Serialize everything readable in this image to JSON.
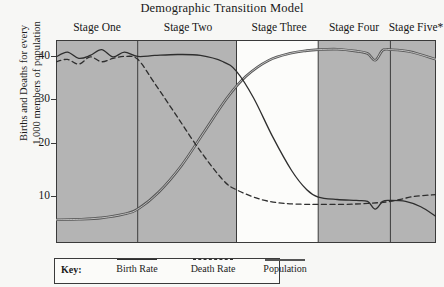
{
  "title": "Demographic Transition Model",
  "axis": {
    "ylabel_line1": "Births and Deaths for every",
    "ylabel_line2": "1,000 members of population",
    "yticks": [
      "40",
      "30",
      "20",
      "10"
    ]
  },
  "stages": [
    {
      "label": "Stage One",
      "shaded": true
    },
    {
      "label": "Stage Two",
      "shaded": true
    },
    {
      "label": "Stage Three",
      "shaded": false
    },
    {
      "label": "Stage Four",
      "shaded": true
    },
    {
      "label": "Stage Five*",
      "shaded": true
    }
  ],
  "legend": {
    "key_label": "Key:",
    "entries": [
      {
        "label": "Birth Rate",
        "style": "solid"
      },
      {
        "label": "Death Rate",
        "style": "dashed"
      },
      {
        "label": "Population",
        "style": "thick"
      }
    ]
  },
  "colors": {
    "shaded_band": "#b4b4b4",
    "unshaded_band": "#fcfcfa",
    "page_background": "#f7f7f5",
    "line": "#2e2e2e",
    "population_line": "#555555",
    "frame": "#3a3a3a"
  },
  "chart_data": {
    "type": "line",
    "title": "Demographic Transition Model",
    "xlabel": "",
    "ylabel": "Births and Deaths for every 1,000 members of population",
    "ylim": [
      0,
      42
    ],
    "xlim": [
      0,
      100
    ],
    "grid": false,
    "legend_position": "bottom-left",
    "stage_boundaries": [
      0,
      21.5,
      47.5,
      69,
      88,
      100
    ],
    "stage_names": [
      "Stage One",
      "Stage Two",
      "Stage Three",
      "Stage Four",
      "Stage Five*"
    ],
    "stage_shading": [
      "gray",
      "gray",
      "white",
      "gray",
      "gray"
    ],
    "series": [
      {
        "name": "Birth Rate",
        "style": "solid",
        "x": [
          0,
          3,
          6,
          9,
          12,
          15,
          18,
          21.5,
          26,
          32,
          38,
          44,
          47.5,
          52,
          57,
          62,
          66,
          69,
          74,
          79,
          82,
          84,
          86,
          88,
          92,
          96,
          100
        ],
        "values": [
          38.5,
          39.5,
          38.2,
          38.8,
          40.0,
          38.5,
          39.5,
          38.6,
          38.8,
          39.0,
          38.8,
          37.5,
          35.5,
          30.0,
          22.0,
          15.0,
          11.0,
          9.5,
          9.0,
          8.8,
          8.6,
          7.0,
          8.6,
          8.8,
          8.6,
          7.5,
          5.5
        ]
      },
      {
        "name": "Death Rate",
        "style": "dashed",
        "x": [
          0,
          3,
          6,
          9,
          12,
          15,
          18,
          21.5,
          26,
          32,
          38,
          44,
          47.5,
          54,
          60,
          66,
          69,
          76,
          82,
          88,
          94,
          100
        ],
        "values": [
          37.5,
          38.0,
          37.0,
          38.5,
          37.5,
          38.2,
          38.6,
          38.0,
          33.0,
          26.0,
          19.0,
          13.0,
          11.0,
          9.0,
          8.2,
          8.0,
          8.0,
          8.0,
          8.2,
          8.6,
          9.6,
          10.0
        ]
      },
      {
        "name": "Population",
        "style": "thick",
        "x": [
          0,
          6,
          12,
          18,
          21.5,
          27,
          33,
          39,
          45,
          50,
          56,
          62,
          66,
          69,
          74,
          79,
          82,
          84,
          86,
          88,
          93,
          100
        ],
        "values": [
          4.8,
          4.9,
          5.2,
          6.0,
          7.0,
          10.5,
          16.0,
          23.0,
          30.0,
          34.5,
          37.8,
          39.3,
          39.8,
          40.0,
          40.1,
          39.7,
          39.2,
          37.8,
          39.9,
          40.0,
          39.6,
          38.0
        ]
      }
    ]
  }
}
